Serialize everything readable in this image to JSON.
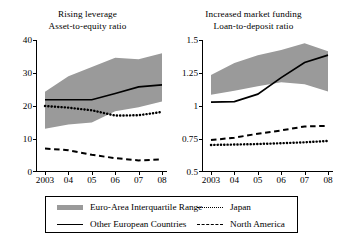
{
  "figure": {
    "background": "#ffffff",
    "band_color": "#9a9a9a",
    "line_color": "#000000"
  },
  "legend": {
    "items": [
      {
        "key": "band",
        "label": "Euro-Area Interquartile Range",
        "style": "band"
      },
      {
        "key": "japan",
        "label": "Japan",
        "style": "dotted"
      },
      {
        "key": "other",
        "label": "Other European Countries",
        "style": "solid"
      },
      {
        "key": "north",
        "label": "North America",
        "style": "dashed"
      }
    ]
  },
  "chart_data": [
    {
      "type": "line",
      "panel": "left",
      "title": "Rising leverage",
      "subtitle": "Asset-to-equity ratio",
      "xlabel": "",
      "ylabel": "",
      "x": [
        "2003",
        "04",
        "05",
        "06",
        "07",
        "08"
      ],
      "xticklabels": [
        "2003",
        "04",
        "05",
        "06",
        "07",
        "08"
      ],
      "yticks": [
        0,
        10,
        20,
        30,
        40
      ],
      "yticklabels": [
        "0",
        "10",
        "20",
        "30",
        "40"
      ],
      "ylim": [
        0,
        40
      ],
      "grid": false,
      "legend_position": "below-figure",
      "band": {
        "name": "Euro-Area Interquartile Range",
        "upper": [
          24.3,
          29.0,
          31.8,
          34.6,
          34.2,
          36.0
        ],
        "lower": [
          13.1,
          14.4,
          15.0,
          18.4,
          19.6,
          21.4
        ]
      },
      "series": [
        {
          "name": "Other European Countries",
          "style": "solid",
          "values": [
            21.9,
            21.9,
            21.9,
            23.8,
            25.8,
            26.4
          ]
        },
        {
          "name": "Japan",
          "style": "dotted",
          "values": [
            20.0,
            19.5,
            18.7,
            17.1,
            17.2,
            18.2
          ]
        },
        {
          "name": "North America",
          "style": "dashed",
          "values": [
            7.1,
            6.6,
            5.2,
            4.2,
            3.5,
            3.8
          ]
        }
      ]
    },
    {
      "type": "line",
      "panel": "right",
      "title": "Increased market funding",
      "subtitle": "Loan-to-deposit ratio",
      "xlabel": "",
      "ylabel": "",
      "x": [
        "2003",
        "04",
        "05",
        "06",
        "07",
        "08"
      ],
      "xticklabels": [
        "2003",
        "04",
        "05",
        "06",
        "07",
        "08"
      ],
      "yticks": [
        0.5,
        0.75,
        1,
        1.25,
        1.5
      ],
      "yticklabels": [
        "0.5",
        "0.75",
        "1",
        "1.25",
        "1.5"
      ],
      "ylim": [
        0.5,
        1.5
      ],
      "grid": false,
      "legend_position": "below-figure",
      "band": {
        "name": "Euro-Area Interquartile Range",
        "upper": [
          1.235,
          1.325,
          1.385,
          1.425,
          1.475,
          1.415
        ],
        "lower": [
          1.085,
          1.115,
          1.15,
          1.18,
          1.165,
          1.11
        ]
      },
      "series": [
        {
          "name": "Other European Countries",
          "style": "solid",
          "values": [
            1.03,
            1.033,
            1.09,
            1.215,
            1.33,
            1.385
          ]
        },
        {
          "name": "North America",
          "style": "dashed",
          "values": [
            0.742,
            0.76,
            0.79,
            0.815,
            0.845,
            0.85
          ]
        },
        {
          "name": "Japan",
          "style": "dotted",
          "values": [
            0.705,
            0.708,
            0.712,
            0.718,
            0.725,
            0.735
          ]
        }
      ]
    }
  ]
}
